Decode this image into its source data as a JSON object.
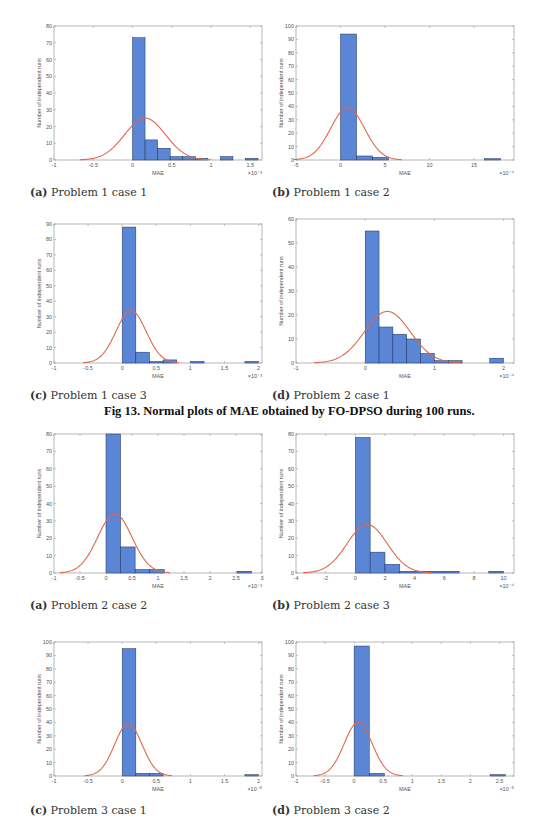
{
  "figure13": {
    "title": "Fig 13. Normal plots of MAE obtained by FO-DPSO during 100 runs."
  },
  "colors": {
    "bar_fill": "#5b86d6",
    "bar_edge": "#1f2f5a",
    "curve": "#e0674a",
    "axis": "#888888"
  },
  "chart_data": [
    {
      "id": "p1c1",
      "type": "bar",
      "subtitle_label": "(a)",
      "subtitle": "Problem 1 case 1",
      "xlabel": "MAE",
      "ylabel": "Number of independent runs",
      "x_exponent": "×10⁻³",
      "xlim": [
        -1,
        1.65
      ],
      "ylim": [
        0,
        80
      ],
      "xticks": [
        -1,
        -0.5,
        0,
        0.5,
        1,
        1.5
      ],
      "xtick_labels": [
        "-1",
        "-0.5",
        "0",
        "0.5",
        "1",
        "1.5"
      ],
      "yticks": [
        0,
        10,
        20,
        30,
        40,
        50,
        60,
        70,
        80
      ],
      "bin_edges": [
        0,
        0.16,
        0.32,
        0.48,
        0.64,
        0.8,
        0.96,
        1.12,
        1.28,
        1.44,
        1.6
      ],
      "values": [
        73,
        12,
        7,
        2,
        2,
        1,
        0,
        2,
        0,
        1
      ],
      "normal_fit": {
        "mean": 0.16,
        "sd": 0.26,
        "peak": 25
      },
      "grid": false
    },
    {
      "id": "p1c2",
      "type": "bar",
      "subtitle_label": "(b)",
      "subtitle": "Problem 1 case 2",
      "xlabel": "MAE",
      "ylabel": "Number of independent runs",
      "x_exponent": "×10⁻⁴",
      "xlim": [
        -5,
        19.5
      ],
      "ylim": [
        0,
        100
      ],
      "xticks": [
        -5,
        0,
        5,
        10,
        15
      ],
      "xtick_labels": [
        "-5",
        "0",
        "5",
        "10",
        "15"
      ],
      "yticks": [
        0,
        10,
        20,
        30,
        40,
        50,
        60,
        70,
        80,
        90,
        100
      ],
      "bin_edges": [
        0,
        1.8,
        3.6,
        5.4,
        7.2,
        9.0,
        10.8,
        12.6,
        14.4,
        16.2,
        18.0
      ],
      "values": [
        94,
        3,
        2,
        0,
        0,
        0,
        0,
        0,
        0,
        1
      ],
      "normal_fit": {
        "mean": 0.8,
        "sd": 1.9,
        "peak": 39
      },
      "grid": false
    },
    {
      "id": "p1c3",
      "type": "bar",
      "subtitle_label": "(c)",
      "subtitle": "Problem 1 case 3",
      "xlabel": "MAE",
      "ylabel": "Number of independent runs",
      "x_exponent": "×10⁻³",
      "xlim": [
        -1,
        2.05
      ],
      "ylim": [
        0,
        90
      ],
      "xticks": [
        -1,
        -0.5,
        0,
        0.5,
        1,
        1.5,
        2
      ],
      "xtick_labels": [
        "-1",
        "-0.5",
        "0",
        "0.5",
        "1",
        "1.5",
        "2"
      ],
      "yticks": [
        0,
        10,
        20,
        30,
        40,
        50,
        60,
        70,
        80,
        90
      ],
      "bin_edges": [
        0,
        0.2,
        0.4,
        0.6,
        0.8,
        1.0,
        1.2,
        1.4,
        1.6,
        1.8,
        2.0
      ],
      "values": [
        88,
        7,
        1,
        2,
        0,
        1,
        0,
        0,
        0,
        1
      ],
      "normal_fit": {
        "mean": 0.13,
        "sd": 0.22,
        "peak": 34
      },
      "grid": false
    },
    {
      "id": "p2c1",
      "type": "bar",
      "subtitle_label": "(d)",
      "subtitle": "Problem 2 case 1",
      "xlabel": "MAE",
      "ylabel": "Number of independent runs",
      "x_exponent": "×10⁻⁴",
      "xlim": [
        -1,
        2.15
      ],
      "ylim": [
        0,
        60
      ],
      "xticks": [
        -1,
        0,
        1,
        2
      ],
      "xtick_labels": [
        "-1",
        "0",
        "1",
        "2"
      ],
      "yticks": [
        0,
        10,
        20,
        30,
        40,
        50,
        60
      ],
      "bin_edges": [
        0,
        0.2,
        0.4,
        0.6,
        0.8,
        1.0,
        1.2,
        1.4,
        1.6,
        1.8,
        2.0
      ],
      "values": [
        55,
        15,
        12,
        10,
        4,
        1,
        1,
        0,
        0,
        2
      ],
      "normal_fit": {
        "mean": 0.32,
        "sd": 0.33,
        "peak": 21.5
      },
      "grid": false
    },
    {
      "id": "p2c2",
      "type": "bar",
      "subtitle_label": "(a)",
      "subtitle": "Problem 2 case 2",
      "xlabel": "MAE",
      "ylabel": "Number of independent runs",
      "x_exponent": "×10⁻³",
      "xlim": [
        -1,
        3
      ],
      "ylim": [
        0,
        80
      ],
      "xticks": [
        -1,
        -0.5,
        0,
        0.5,
        1,
        1.5,
        2,
        2.5,
        3
      ],
      "xtick_labels": [
        "-1",
        "-0.5",
        "0",
        "0.5",
        "1",
        "1.5",
        "2",
        "2.5",
        "3"
      ],
      "yticks": [
        0,
        10,
        20,
        30,
        40,
        50,
        60,
        70,
        80
      ],
      "bin_edges": [
        0,
        0.28,
        0.56,
        0.84,
        1.12,
        1.4,
        1.68,
        1.96,
        2.24,
        2.52,
        2.8
      ],
      "values": [
        81,
        15,
        2,
        2,
        0,
        0,
        0,
        0,
        0,
        1
      ],
      "normal_fit": {
        "mean": 0.17,
        "sd": 0.33,
        "peak": 34
      },
      "grid": false
    },
    {
      "id": "p2c3",
      "type": "bar",
      "subtitle_label": "(b)",
      "subtitle": "Problem 2 case 3",
      "xlabel": "MAE",
      "ylabel": "Number of independent runs",
      "x_exponent": "×10⁻⁴",
      "xlim": [
        -4,
        10.7
      ],
      "ylim": [
        0,
        80
      ],
      "xticks": [
        -4,
        -2,
        0,
        2,
        4,
        6,
        8,
        10
      ],
      "xtick_labels": [
        "-4",
        "-2",
        "0",
        "2",
        "4",
        "6",
        "8",
        "10"
      ],
      "yticks": [
        0,
        10,
        20,
        30,
        40,
        50,
        60,
        70,
        80
      ],
      "bin_edges": [
        0,
        1,
        2,
        3,
        4,
        5,
        6,
        7,
        8,
        9,
        10
      ],
      "values": [
        78,
        12,
        5,
        1,
        1,
        1,
        1,
        0,
        0,
        1
      ],
      "normal_fit": {
        "mean": 0.8,
        "sd": 1.35,
        "peak": 28
      },
      "grid": false
    },
    {
      "id": "p3c1",
      "type": "bar",
      "subtitle_label": "(c)",
      "subtitle": "Problem 3 case 1",
      "xlabel": "MAE",
      "ylabel": "Number of independent runs",
      "x_exponent": "×10⁻⁵",
      "xlim": [
        -1,
        2.05
      ],
      "ylim": [
        0,
        100
      ],
      "xticks": [
        -1,
        -0.5,
        0,
        0.5,
        1,
        1.5,
        2
      ],
      "xtick_labels": [
        "-1",
        "-0.5",
        "0",
        "0.5",
        "1",
        "1.5",
        "2"
      ],
      "yticks": [
        0,
        10,
        20,
        30,
        40,
        50,
        60,
        70,
        80,
        90,
        100
      ],
      "bin_edges": [
        0,
        0.2,
        0.4,
        0.6,
        0.8,
        1.0,
        1.2,
        1.4,
        1.6,
        1.8,
        2.0
      ],
      "values": [
        95,
        2,
        2,
        0,
        0,
        0,
        0,
        0,
        0,
        1
      ],
      "normal_fit": {
        "mean": 0.09,
        "sd": 0.2,
        "peak": 39
      },
      "grid": false
    },
    {
      "id": "p3c2",
      "type": "bar",
      "subtitle_label": "(d)",
      "subtitle": "Problem 3 case 2",
      "xlabel": "MAE",
      "ylabel": "Number of independent runs",
      "x_exponent": "×10⁻⁵",
      "xlim": [
        -1,
        2.75
      ],
      "ylim": [
        0,
        100
      ],
      "xticks": [
        -1,
        -0.5,
        0,
        0.5,
        1,
        1.5,
        2,
        2.5
      ],
      "xtick_labels": [
        "-1",
        "-0.5",
        "0",
        "0.5",
        "1",
        "1.5",
        "2",
        "2.5"
      ],
      "yticks": [
        0,
        10,
        20,
        30,
        40,
        50,
        60,
        70,
        80,
        90,
        100
      ],
      "bin_edges": [
        0,
        0.26,
        0.52,
        0.78,
        1.04,
        1.3,
        1.56,
        1.82,
        2.08,
        2.34,
        2.6
      ],
      "values": [
        97,
        2,
        0,
        0,
        0,
        0,
        0,
        0,
        0,
        1
      ],
      "normal_fit": {
        "mean": 0.07,
        "sd": 0.24,
        "peak": 40
      },
      "grid": false
    }
  ]
}
